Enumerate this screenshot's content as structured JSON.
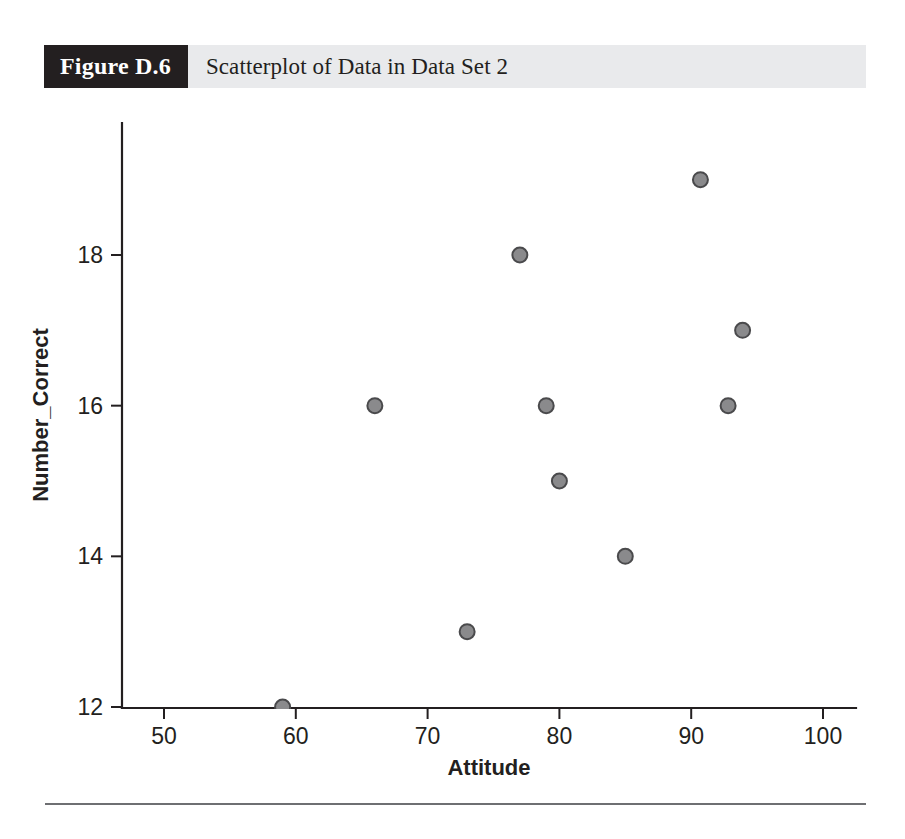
{
  "figure": {
    "number_label": "Figure D.6",
    "caption": "Scatterplot of Data in Data Set 2"
  },
  "colors": {
    "banner_dark": "#231f20",
    "banner_light": "#e9eaec",
    "marker_fill": "#8a8a8c",
    "marker_stroke": "#4a4a4c",
    "axis": "#231f20",
    "rule": "#6e6f72"
  },
  "chart_data": {
    "type": "scatter",
    "title": "Scatterplot of Data in Data Set 2",
    "xlabel": "Attitude",
    "ylabel": "Number_Correct",
    "xlim": [
      47,
      103
    ],
    "ylim": [
      12,
      19.6
    ],
    "xticks": [
      50,
      60,
      70,
      80,
      90,
      100
    ],
    "xticklabels": [
      "50",
      "60",
      "70",
      "80",
      "90",
      "100"
    ],
    "yticks": [
      12,
      14,
      16,
      18
    ],
    "yticklabels": [
      "12",
      "14",
      "16",
      "18"
    ],
    "grid": false,
    "legend": null,
    "series": [
      {
        "name": "Data Set 2",
        "marker": "circle",
        "points": [
          {
            "x": 59,
            "y": 12
          },
          {
            "x": 66,
            "y": 16
          },
          {
            "x": 73,
            "y": 13
          },
          {
            "x": 77,
            "y": 18
          },
          {
            "x": 79,
            "y": 16
          },
          {
            "x": 80,
            "y": 15
          },
          {
            "x": 85,
            "y": 14
          },
          {
            "x": 90.7,
            "y": 19
          },
          {
            "x": 92.8,
            "y": 16
          },
          {
            "x": 93.9,
            "y": 17
          }
        ]
      }
    ]
  }
}
